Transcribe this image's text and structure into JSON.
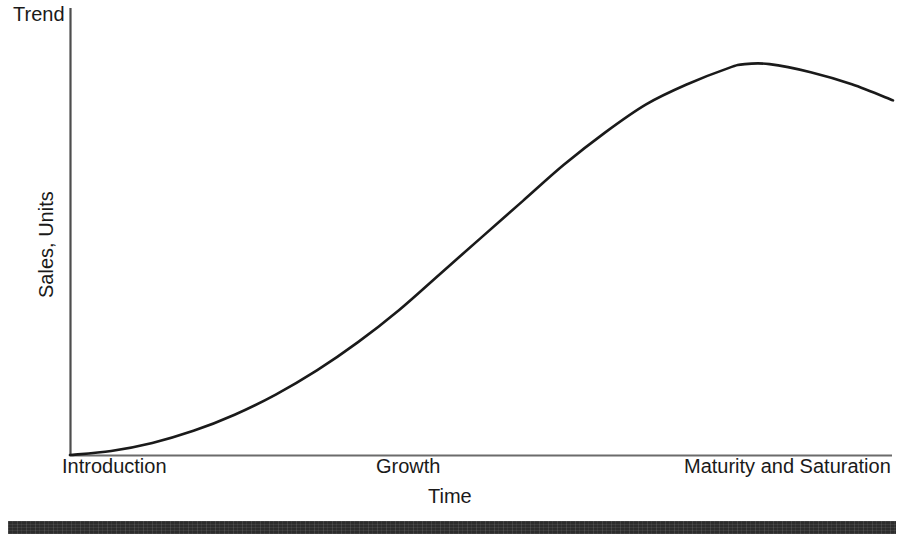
{
  "chart_data": {
    "type": "line",
    "title": "",
    "subtitle": "",
    "xlabel": "Time",
    "ylabel": "Sales, Units",
    "corner_label": "Trend",
    "grid": false,
    "legend": null,
    "axis_style": "open L-shaped axes, no numeric ticks",
    "xlim": [
      0,
      100
    ],
    "ylim": [
      0,
      100
    ],
    "x_tick_labels": [
      "Introduction",
      "Growth",
      "Maturity and Saturation"
    ],
    "y_tick_labels": [],
    "series": [
      {
        "name": "Product life cycle S-curve",
        "x": [
          0,
          5,
          10,
          15,
          20,
          25,
          30,
          35,
          40,
          45,
          50,
          55,
          60,
          65,
          70,
          75,
          80,
          82,
          85,
          90,
          95,
          100
        ],
        "y": [
          0,
          1,
          3,
          6,
          10,
          15,
          21,
          28,
          36,
          45,
          54,
          63,
          72,
          80,
          87,
          92,
          96,
          97,
          97,
          95,
          92,
          88
        ]
      }
    ],
    "annotations": [
      "Curve rises slowly during Introduction",
      "Steep linear rise through Growth",
      "Plateaus and peaks during Maturity and Saturation, then declines"
    ],
    "colors": {
      "curve": "#1a1a1a",
      "axis": "#4d4d4d",
      "text": "#1a1a1a",
      "footer_bar": "#2c2c2c",
      "background": "#ffffff"
    }
  },
  "labels": {
    "trend": "Trend",
    "y_axis": "Sales, Units",
    "x_axis": "Time",
    "stage_introduction": "Introduction",
    "stage_growth": "Growth",
    "stage_maturity": "Maturity and Saturation"
  }
}
